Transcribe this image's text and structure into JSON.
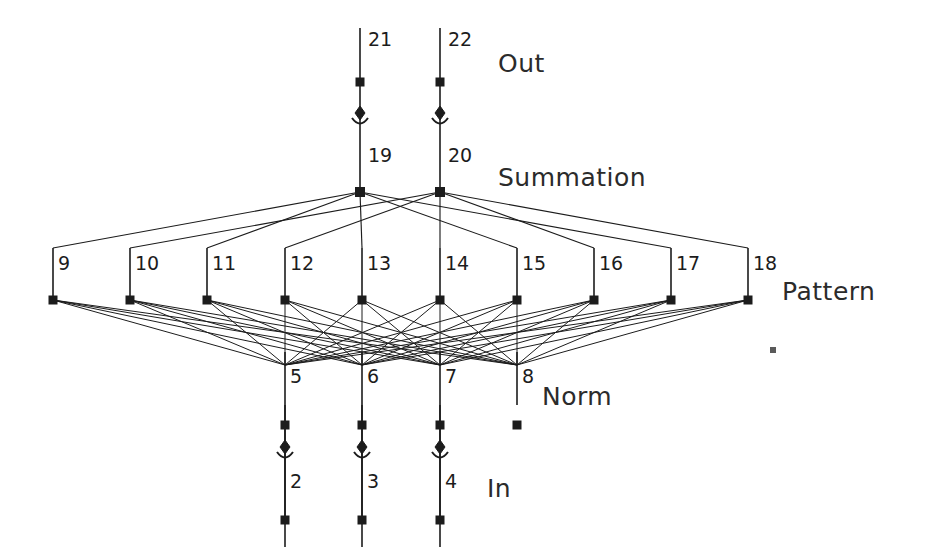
{
  "diagram": {
    "background_color": "#ffffff",
    "ink_color": "#1c1c1c",
    "width": 925,
    "height": 547,
    "layers": [
      {
        "key": "out",
        "label": "Out",
        "label_x": 498,
        "label_y": 72,
        "node_y": 82,
        "nodes": [
          {
            "id": "21",
            "x": 360,
            "label_dx": 8,
            "label_dy": -36
          },
          {
            "id": "22",
            "x": 440,
            "label_dx": 8,
            "label_dy": -36
          }
        ]
      },
      {
        "key": "summation",
        "label": "Summation",
        "label_x": 498,
        "label_y": 186,
        "node_y": 192,
        "nodes": [
          {
            "id": "19",
            "x": 360,
            "label_dx": 8,
            "label_dy": -30
          },
          {
            "id": "20",
            "x": 440,
            "label_dx": 8,
            "label_dy": -30
          }
        ]
      },
      {
        "key": "pattern",
        "label": "Pattern",
        "label_x": 782,
        "label_y": 300,
        "node_y": 300,
        "nodes": [
          {
            "id": "9",
            "x": 53,
            "label_dx": 5,
            "label_dy": -30
          },
          {
            "id": "10",
            "x": 130,
            "label_dx": 5,
            "label_dy": -30
          },
          {
            "id": "11",
            "x": 207,
            "label_dx": 5,
            "label_dy": -30
          },
          {
            "id": "12",
            "x": 285,
            "label_dx": 5,
            "label_dy": -30
          },
          {
            "id": "13",
            "x": 362,
            "label_dx": 5,
            "label_dy": -30
          },
          {
            "id": "14",
            "x": 440,
            "label_dx": 5,
            "label_dy": -30
          },
          {
            "id": "15",
            "x": 517,
            "label_dx": 5,
            "label_dy": -30
          },
          {
            "id": "16",
            "x": 594,
            "label_dx": 5,
            "label_dy": -30
          },
          {
            "id": "17",
            "x": 671,
            "label_dx": 5,
            "label_dy": -30
          },
          {
            "id": "18",
            "x": 748,
            "label_dx": 5,
            "label_dy": -30
          }
        ]
      },
      {
        "key": "norm",
        "label": "Norm",
        "label_x": 542,
        "label_y": 405,
        "node_y": 365,
        "nodes": [
          {
            "id": "5",
            "x": 285,
            "label_dx": 5,
            "label_dy": 18
          },
          {
            "id": "6",
            "x": 362,
            "label_dx": 5,
            "label_dy": 18
          },
          {
            "id": "7",
            "x": 440,
            "label_dx": 5,
            "label_dy": 18
          },
          {
            "id": "8",
            "x": 517,
            "label_dx": 5,
            "label_dy": 18
          }
        ]
      },
      {
        "key": "in",
        "label": "In",
        "label_x": 487,
        "label_y": 497,
        "node_y": 520,
        "nodes": [
          {
            "id": "2",
            "x": 285,
            "label_dx": 5,
            "label_dy": -32
          },
          {
            "id": "3",
            "x": 362,
            "label_dx": 5,
            "label_dy": -32
          },
          {
            "id": "4",
            "x": 440,
            "label_dx": 5,
            "label_dy": -32
          }
        ]
      }
    ],
    "summation_assignment": {
      "to_19": [
        "9",
        "11",
        "13",
        "15",
        "17"
      ],
      "to_20": [
        "10",
        "12",
        "14",
        "16",
        "18"
      ]
    },
    "pattern_to_norm": "fully-connected",
    "norm_terminals": [
      "5",
      "6",
      "7"
    ],
    "stray_marker": {
      "x": 773,
      "y": 350,
      "size": 6
    }
  }
}
